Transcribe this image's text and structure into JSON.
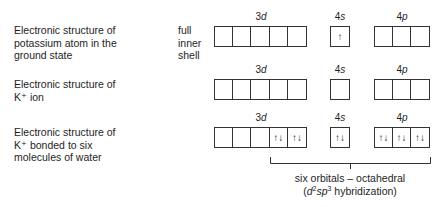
{
  "rows": [
    {
      "label": [
        "Electronic structure of",
        "potassium atom in the",
        "ground state"
      ],
      "orbitals": {
        "3d": [
          "",
          "",
          "",
          "",
          ""
        ],
        "4s": [
          "↑"
        ],
        "4p": [
          "",
          "",
          ""
        ]
      }
    },
    {
      "label": [
        "Electronic structure of",
        "K⁺ ion"
      ],
      "orbitals": {
        "3d": [
          "",
          "",
          "",
          "",
          ""
        ],
        "4s": [
          ""
        ],
        "4p": [
          "",
          "",
          ""
        ]
      }
    },
    {
      "label": [
        "Electronic structure of",
        "K⁺ bonded to six",
        "molecules of water"
      ],
      "orbitals": {
        "3d": [
          "",
          "",
          "",
          "↑↓",
          "↑↓"
        ],
        "4s": [
          "↑↓"
        ],
        "4p": [
          "↑↓",
          "↑↓",
          "↑↓"
        ]
      }
    }
  ],
  "inner_shell": [
    "full",
    "inner",
    "shell"
  ],
  "headers": {
    "d_num": "3",
    "d_letter": "d",
    "s_num": "4",
    "s_letter": "s",
    "p_num": "4",
    "p_letter": "p"
  },
  "caption": {
    "line1": "six orbitals – octahedral",
    "open": "(",
    "d": "d",
    "d_sup": "2",
    "sp": "sp",
    "sp_sup": "3",
    "rest": " hybridization)"
  },
  "colors": {
    "line": "#333333",
    "text": "#1e1e1e"
  }
}
